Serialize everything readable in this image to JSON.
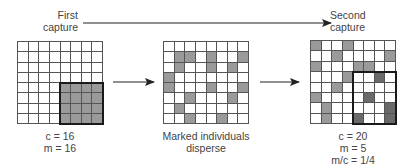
{
  "top_arrow": {
    "from_label": "First capture",
    "to_label": "Second capture"
  },
  "labels": {
    "first_capture_line1": "First",
    "first_capture_line2": "capture",
    "second_capture_line1": "Second",
    "second_capture_line2": "capture"
  },
  "grids": [
    {
      "name": "first-capture-grid",
      "rows": 8,
      "cols": 8,
      "shaded_cells": [
        [
          4,
          4
        ],
        [
          4,
          5
        ],
        [
          4,
          6
        ],
        [
          4,
          7
        ],
        [
          5,
          4
        ],
        [
          5,
          5
        ],
        [
          5,
          6
        ],
        [
          5,
          7
        ],
        [
          6,
          4
        ],
        [
          6,
          5
        ],
        [
          6,
          6
        ],
        [
          6,
          7
        ],
        [
          7,
          4
        ],
        [
          7,
          5
        ],
        [
          7,
          6
        ],
        [
          7,
          7
        ]
      ],
      "dark_cells": [],
      "box": {
        "row": 4,
        "col": 4,
        "rows": 4,
        "cols": 4
      },
      "caption": [
        "c = 16",
        "m = 16"
      ]
    },
    {
      "name": "dispersal-grid",
      "rows": 8,
      "cols": 8,
      "shaded_cells": [
        [
          1,
          1
        ],
        [
          1,
          2
        ],
        [
          1,
          4
        ],
        [
          1,
          7
        ],
        [
          2,
          1
        ],
        [
          2,
          4
        ],
        [
          2,
          6
        ],
        [
          3,
          0
        ],
        [
          4,
          0
        ],
        [
          4,
          4
        ],
        [
          4,
          7
        ],
        [
          5,
          2
        ],
        [
          5,
          6
        ],
        [
          6,
          1
        ],
        [
          7,
          2
        ],
        [
          7,
          5
        ]
      ],
      "dark_cells": [],
      "box": null,
      "caption": [
        "Marked individuals",
        "disperse"
      ]
    },
    {
      "name": "second-capture-grid",
      "rows": 8,
      "cols": 8,
      "shaded_cells": [
        [
          0,
          0
        ],
        [
          0,
          3
        ],
        [
          1,
          2
        ],
        [
          1,
          7
        ],
        [
          2,
          0
        ],
        [
          2,
          4
        ],
        [
          2,
          5
        ],
        [
          3,
          3
        ],
        [
          4,
          2
        ],
        [
          5,
          0
        ],
        [
          6,
          1
        ],
        [
          7,
          1
        ]
      ],
      "dark_cells": [
        [
          3,
          6
        ],
        [
          5,
          5
        ],
        [
          6,
          7
        ],
        [
          7,
          4
        ],
        [
          7,
          7
        ]
      ],
      "box": {
        "row": 3,
        "col": 4,
        "rows": 5,
        "cols": 4
      },
      "caption": [
        "c = 20",
        "m = 5",
        "m/c = 1/4"
      ]
    }
  ],
  "colors": {
    "shaded": "#9a9a9a",
    "dark": "#6a6a6a",
    "grid_line": "#555555",
    "box": "#1a1a1a",
    "arrow": "#222222"
  }
}
